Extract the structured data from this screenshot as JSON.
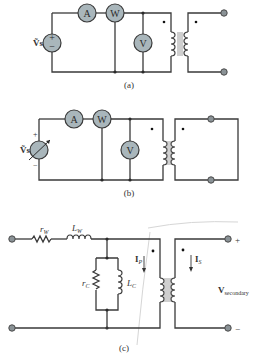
{
  "diagram": {
    "panels": [
      {
        "caption": "(a)",
        "source_label": "Ṽs",
        "source_type": "ac-source",
        "meters": [
          "A",
          "W",
          "V"
        ],
        "secondary": "open-circuit"
      },
      {
        "caption": "(b)",
        "source_label": "Ṽs",
        "source_type": "variable-ac-source",
        "source_plus": "+",
        "source_minus": "−",
        "meters": [
          "A",
          "W",
          "V"
        ],
        "secondary": "short-circuit"
      },
      {
        "caption": "(c)",
        "components": {
          "series_resistor": "r",
          "series_resistor_sub": "W",
          "series_inductor": "L",
          "series_inductor_sub": "W",
          "core_resistor": "r",
          "core_resistor_sub": "C",
          "core_inductor": "L",
          "core_inductor_sub": "C"
        },
        "primary_current": "I",
        "primary_current_sub": "P",
        "secondary_current": "I",
        "secondary_current_sub": "S",
        "output_label": "V",
        "output_label_sub": "secondary",
        "output_plus": "+",
        "output_minus": "−"
      }
    ]
  }
}
